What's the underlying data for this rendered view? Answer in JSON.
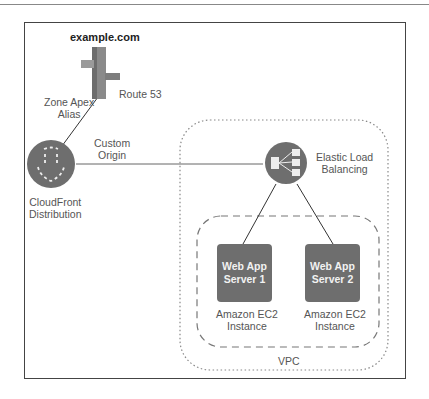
{
  "domain_title": "example.com",
  "nodes": {
    "route53": {
      "label": "Route 53",
      "icon": "route53-signpost-icon"
    },
    "cloudfront": {
      "label_line1": "CloudFront",
      "label_line2": "Distribution",
      "icon": "cloudfront-icon"
    },
    "elb": {
      "label_line1": "Elastic Load",
      "label_line2": "Balancing",
      "icon": "load-balancer-icon"
    },
    "server1": {
      "line1": "Web App",
      "line2": "Server 1",
      "caption1": "Amazon EC2",
      "caption2": "Instance"
    },
    "server2": {
      "line1": "Web App",
      "line2": "Server 2",
      "caption1": "Amazon EC2",
      "caption2": "Instance"
    }
  },
  "edges": {
    "route53_cloudfront": {
      "label_line1": "Zone Apex",
      "label_line2": "Alias"
    },
    "cloudfront_elb": {
      "label_line1": "Custom",
      "label_line2": "Origin"
    }
  },
  "groups": {
    "vpc": {
      "label": "VPC"
    }
  },
  "colors": {
    "node_fill": "#6e6e6e",
    "frame": "#444444",
    "text": "#555555"
  }
}
